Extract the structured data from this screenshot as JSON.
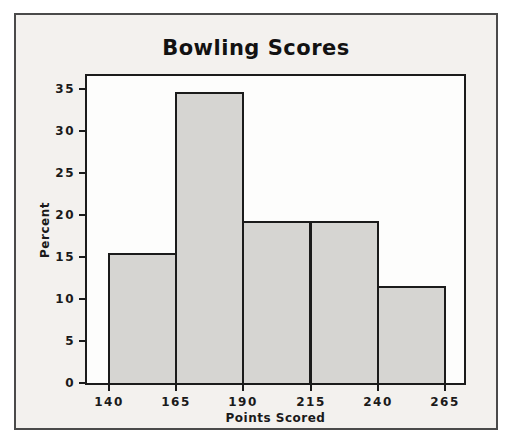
{
  "chart_data": {
    "type": "bar",
    "subtype": "histogram",
    "title": "Bowling Scores",
    "xlabel": "Points Scored",
    "ylabel": "Percent",
    "categories": [
      "140-165",
      "165-190",
      "190-215",
      "215-240",
      "240-265"
    ],
    "bin_edges": [
      140,
      165,
      190,
      215,
      240,
      265
    ],
    "values": [
      15.4,
      34.6,
      19.2,
      19.2,
      11.5
    ],
    "x_ticks": [
      "140",
      "165",
      "190",
      "215",
      "240",
      "265"
    ],
    "y_ticks": [
      "0",
      "5",
      "10",
      "15",
      "20",
      "25",
      "30",
      "35"
    ],
    "xlim": [
      132,
      272
    ],
    "ylim": [
      0,
      36.6
    ],
    "grid": false,
    "legend_position": "none",
    "colors": {
      "figure_bg": "#f3f1ee",
      "figure_border": "#4a4a4a",
      "plot_bg": "#fdfdfc",
      "bar_fill": "#d6d5d2",
      "bar_border": "#1b1b1b",
      "axis_line": "#1b1b1b",
      "text": "#1a1a1a"
    }
  }
}
